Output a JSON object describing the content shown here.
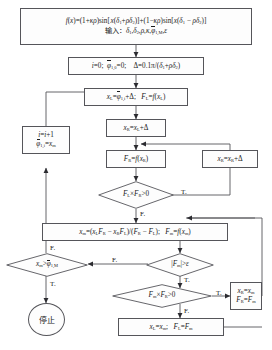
{
  "diagram": {
    "type": "flowchart",
    "language": "zh-CN",
    "title": "",
    "nodes": {
      "formula": {
        "shape": "process",
        "line1": "f(x)=(1+κρ)sin[ x(δ1+ρδ2)]+(1−κρ)sin[x(δ1 − ρδ2)]",
        "line2_label": "输入：",
        "line2_vars": "δ1,δ2,ρ,κ,φ1,M,ε"
      },
      "init": {
        "shape": "process",
        "text": "i=0;  φ1,0=0;    Δ=0.1π/(δ1+ρδ2)"
      },
      "xl": {
        "shape": "process",
        "text": "xL=φ1,i+Δ;   FL=f(xL)"
      },
      "xr": {
        "shape": "process",
        "text": "xR=xL+Δ"
      },
      "fr": {
        "shape": "process",
        "text": "FR=f(xR)"
      },
      "xr_step": {
        "shape": "process",
        "text": "xR=xR+Δ"
      },
      "incr": {
        "shape": "process",
        "line1": "i=i+1",
        "line2": "φ1,i=xm"
      },
      "xm": {
        "shape": "process",
        "text": "xm=(xLFR−xRFL)/(FR−FL);   Fm=f(xm)"
      },
      "assign_r": {
        "shape": "process",
        "line1": "xR=xm",
        "line2": "FR=Fm"
      },
      "assign_l": {
        "shape": "process",
        "text": "xL=xm;   FL=Fm"
      },
      "stop": {
        "shape": "terminator",
        "text": "停止"
      }
    },
    "decisions": {
      "flfr": {
        "text": "FL×FR>0"
      },
      "xm_gt": {
        "text": "xm>φ1,M"
      },
      "fm_eps": {
        "text": "|Fm|>ε"
      },
      "fmfr": {
        "text": "Fm×FR>0"
      }
    },
    "edge_labels": {
      "flfr_true": "T.",
      "flfr_false": "F.",
      "xm_gt_false": "F.",
      "xm_gt_true": "T.",
      "fm_eps_false": "F.",
      "fm_eps_true": "T.",
      "fmfr_true": "T.",
      "fmfr_false": "F."
    },
    "colors": {
      "stroke": "#55555a",
      "fill": "#fdfdfd",
      "text": "#1a1a1a",
      "background": "#ffffff"
    }
  }
}
